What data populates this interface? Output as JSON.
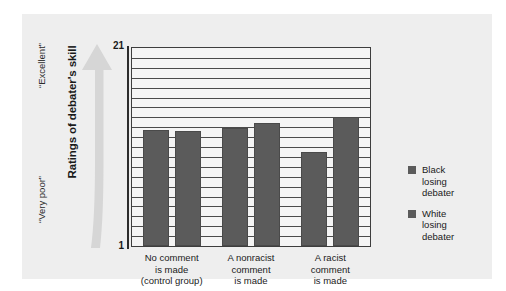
{
  "chart_data": {
    "type": "bar",
    "title": "",
    "xlabel": "",
    "ylabel": "Ratings of debater's skill",
    "ylim": [
      1,
      21
    ],
    "yticks": [
      1,
      21
    ],
    "ytick_labels": [
      "1",
      "21"
    ],
    "grid": true,
    "gridline_count": 20,
    "legend_position": "right",
    "axis_annotations": {
      "high_end": "“Excellent”",
      "low_end": "“Very poor”"
    },
    "categories": [
      "No comment is made (control group)",
      "A nonracist comment is made",
      "A racist comment is made"
    ],
    "category_lines": [
      [
        "No comment",
        "is made",
        "(control group)"
      ],
      [
        "A nonracist",
        "comment",
        "is made"
      ],
      [
        "A racist",
        "comment",
        "is made"
      ]
    ],
    "series": [
      {
        "name": "Black losing debater",
        "name_lines": [
          "Black",
          "losing",
          "debater"
        ],
        "color": "#5b5b5b",
        "values": [
          12.7,
          12.9,
          10.5
        ]
      },
      {
        "name": "White losing debater",
        "name_lines": [
          "White",
          "losing",
          "debater"
        ],
        "color": "#5b5b5b",
        "values": [
          12.6,
          13.4,
          14.0
        ]
      }
    ]
  },
  "colors": {
    "panel_background": "#eeeeee",
    "plot_background": "#f4f4f4",
    "bar": "#5b5b5b",
    "gridline": "#4a4a4a",
    "axis": "#2b2b2b",
    "arrow": "#d4d4d4",
    "text": "#1a1a1a"
  }
}
